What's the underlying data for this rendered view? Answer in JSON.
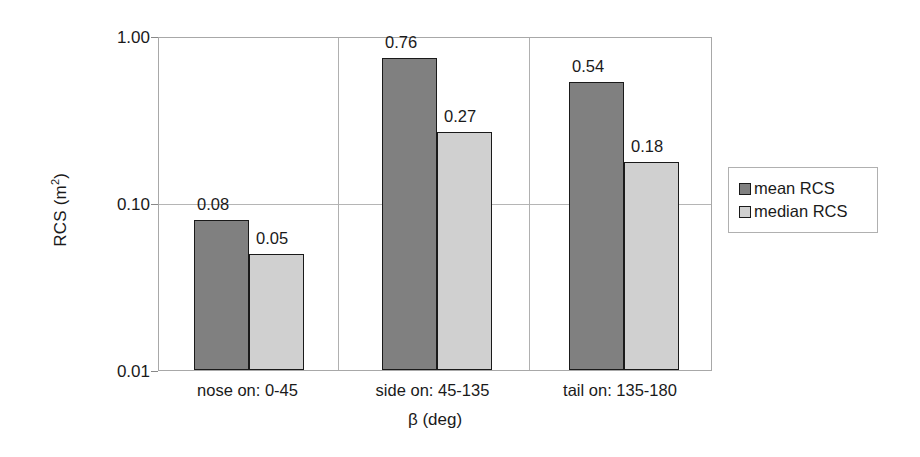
{
  "chart_data": {
    "type": "bar",
    "title": "",
    "xlabel": "β (deg)",
    "ylabel": "RCS (m²)",
    "ylabel_base": "RCS (m",
    "ylabel_exponent": "2",
    "ylabel_close": ")",
    "yscale": "log",
    "ylim": [
      0.01,
      1.0
    ],
    "ytick_labels": [
      "1.00",
      "0.10",
      "0.01"
    ],
    "ytick_values": [
      1.0,
      0.1,
      0.01
    ],
    "grid": true,
    "legend_position": "right",
    "categories": [
      "nose on: 0-45",
      "side on: 45-135",
      "tail on: 135-180"
    ],
    "series": [
      {
        "name": "mean RCS",
        "color": "#808080",
        "values": [
          0.08,
          0.76,
          0.54
        ],
        "labels": [
          "0.08",
          "0.76",
          "0.54"
        ]
      },
      {
        "name": "median RCS",
        "color": "#d0d0d0",
        "values": [
          0.05,
          0.27,
          0.18
        ],
        "labels": [
          "0.05",
          "0.27",
          "0.18"
        ]
      }
    ]
  },
  "legend": {
    "items": [
      {
        "label": "mean RCS",
        "color": "#808080"
      },
      {
        "label": "median RCS",
        "color": "#d0d0d0"
      }
    ]
  },
  "axes": {
    "y_ticks": [
      {
        "label": "1.00"
      },
      {
        "label": "0.10"
      },
      {
        "label": "0.01"
      }
    ],
    "x_title": "β (deg)",
    "y_title": "RCS (m",
    "y_title_sup": "2",
    "y_title_tail": ")"
  }
}
